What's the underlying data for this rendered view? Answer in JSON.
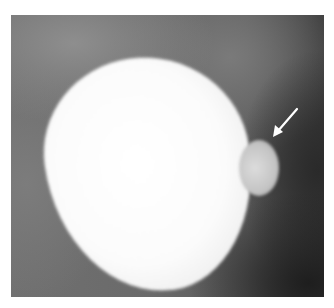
{
  "image": {
    "type": "radiograph",
    "description": "Contrast-filled rounded structure with a small outpouching indicated by a white arrow",
    "annotation": {
      "kind": "arrow",
      "color": "#ffffff",
      "from": [
        286,
        94
      ],
      "to": [
        263,
        121
      ]
    }
  }
}
